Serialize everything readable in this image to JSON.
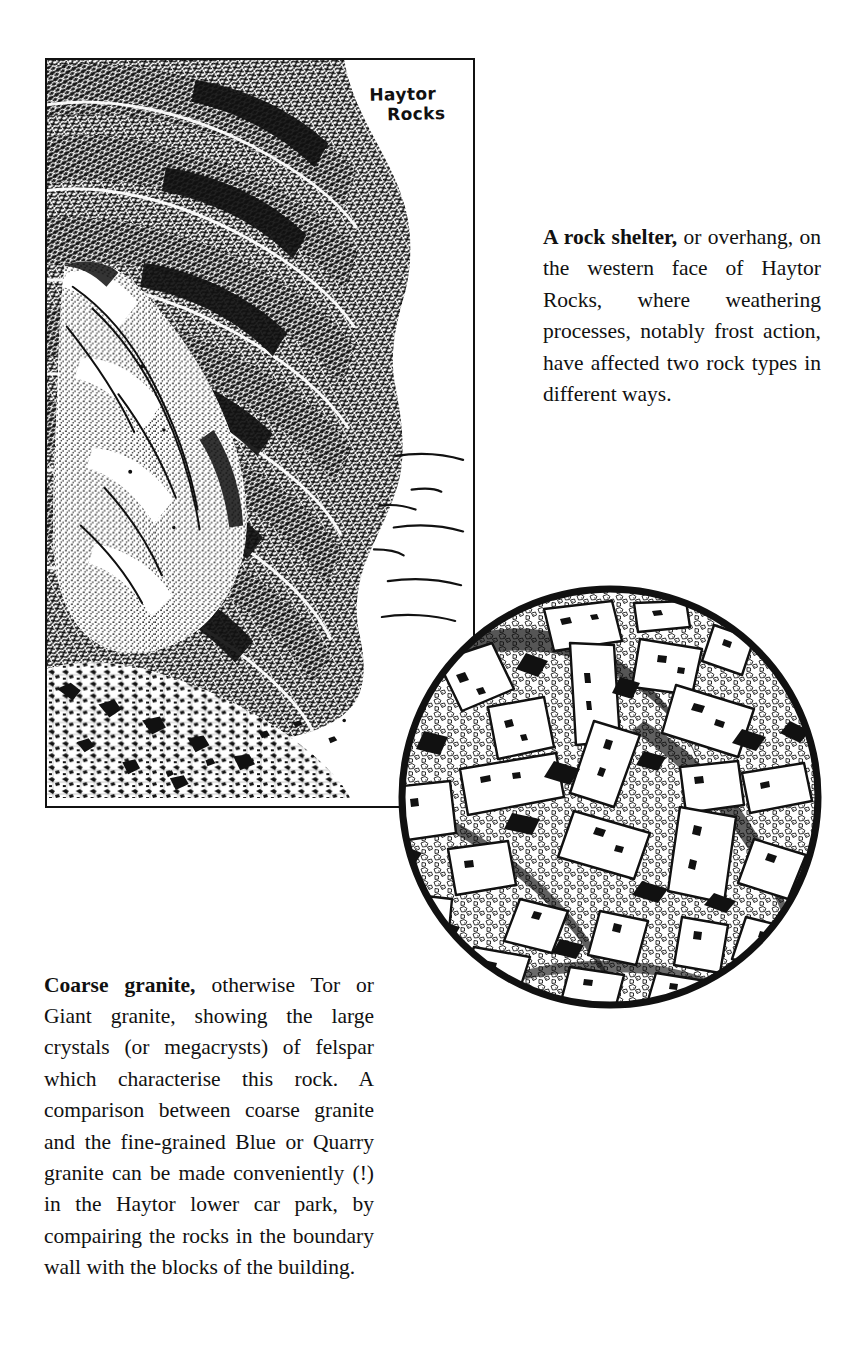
{
  "page": {
    "background_color": "#ffffff",
    "ink_color": "#111111"
  },
  "figures": {
    "rock_shelter": {
      "name": "rock-shelter-illustration",
      "style": "pen-and-ink stipple and hatch drawing",
      "frame": "thin black rectangular border",
      "hand_label_line1": "Haytor",
      "hand_label_line2": "Rocks",
      "depicts": "overhanging granite rock face with shadowed recess and scree slope below"
    },
    "thin_section": {
      "name": "coarse-granite-thin-section-illustration",
      "style": "circular pen-and-ink drawing of rock texture",
      "depicts": "large rectangular felspar megacrysts set in a finer granular groundmass",
      "border": "thick black circle"
    }
  },
  "captions": {
    "rock_shelter": {
      "lead": "A rock shelter,",
      "body": " or overhang, on the western face of Haytor Rocks, where weathering processes, notably frost action, have affected two rock types in different ways.",
      "lines": [
        "A rock shelter, or over-",
        "hang, on the western face",
        "of Haytor Rocks, where",
        "weathering processes,",
        "notably frost action, have",
        "affected two rock types",
        "in different ways."
      ]
    },
    "coarse_granite": {
      "lead": "Coarse granite,",
      "body": " otherwise Tor or Giant granite, showing the large crystals (or megacrysts) of felspar which characterise this rock. A comparison between coarse granite and the fine-grained Blue or Quarry granite can be made conveniently (!) in the Haytor lower car park, by compairing the rocks in the boundary wall with the blocks of the building.",
      "lines": [
        "Coarse granite, otherwise Tor or",
        "Giant granite, showing the large",
        "crystals (or megacrysts) of felspar",
        "which characterise this rock. A",
        "comparison between coarse gran-",
        "ite and the fine-grained Blue or",
        "Quarry granite can be made con-",
        "veniently (!) in the Haytor lower",
        "car park, by compairing the rocks",
        "in the boundary wall with the",
        "blocks of the building."
      ]
    }
  }
}
